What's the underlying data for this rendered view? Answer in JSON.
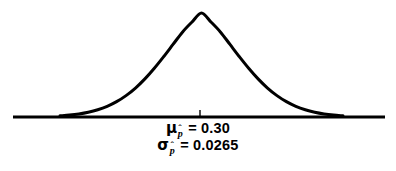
{
  "figure": {
    "background_color": "#ffffff",
    "stroke_color": "#000000",
    "width": 396,
    "height": 171
  },
  "annotations": {
    "mean_symbol": "μ",
    "mean_subscript": "p",
    "mean_hat": "ˆ",
    "mean_equals_value": "= 0.30",
    "sd_symbol": "σ",
    "sd_subscript": "p",
    "sd_hat": "ˆ",
    "sd_equals_value": "= 0.0265",
    "mean_full_text": "μ_p̂ = 0.30",
    "sd_full_text": "σ_p̂ = 0.0265"
  },
  "chart_data": {
    "type": "line",
    "title": "",
    "subtitle": "",
    "xlabel": "",
    "ylabel": "",
    "grid": false,
    "legend": false,
    "legend_position": "none",
    "distribution": "normal",
    "mean": 0.3,
    "std_dev": 0.0265,
    "axis_tick_values": [
      0.3
    ],
    "axis_tick_labels": [
      "μ_p̂ = 0.30"
    ],
    "xlim": [
      0.2205,
      0.3795
    ],
    "ylim": [
      0,
      1
    ],
    "series": [
      {
        "name": "Normal density of p-hat",
        "x": [
          0.2205,
          0.2258,
          0.2311,
          0.2364,
          0.2417,
          0.247,
          0.2523,
          0.2576,
          0.2629,
          0.2682,
          0.2735,
          0.2788,
          0.2841,
          0.2894,
          0.2947,
          0.3,
          0.3053,
          0.3106,
          0.3159,
          0.3212,
          0.3265,
          0.3318,
          0.3371,
          0.3424,
          0.3477,
          0.353,
          0.3583,
          0.3636,
          0.3689,
          0.3742,
          0.3795
        ],
        "y": [
          0.0111,
          0.0183,
          0.0293,
          0.0457,
          0.0695,
          0.1026,
          0.1475,
          0.2057,
          0.2787,
          0.3668,
          0.4688,
          0.5816,
          0.7002,
          0.818,
          0.9139,
          1.0,
          0.9139,
          0.818,
          0.7002,
          0.5816,
          0.4688,
          0.3668,
          0.2787,
          0.2057,
          0.1475,
          0.1026,
          0.0695,
          0.0457,
          0.0293,
          0.0183,
          0.0111
        ]
      }
    ],
    "curve_pixel_path": {
      "peak_x": 200,
      "peak_y": 13,
      "baseline_y": 117,
      "left_tail_x": 60,
      "right_tail_x": 343,
      "stroke_width": 3.0
    },
    "axis_line": {
      "y": 117,
      "x_start": 13,
      "x_end": 385,
      "stroke_width": 3.0
    },
    "center_tick": {
      "x": 200,
      "y_top": 110,
      "y_bottom": 117,
      "stroke_width": 1.4
    }
  }
}
